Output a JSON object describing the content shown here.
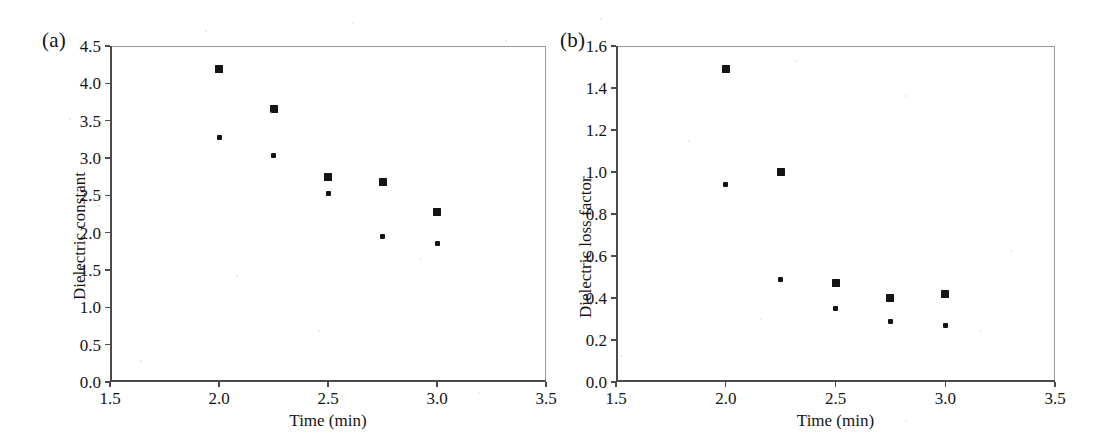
{
  "figure": {
    "background_color": "#ffffff",
    "marker_color": "#141414",
    "axis_color": "#4a4a4a",
    "panels": [
      {
        "key": "a",
        "label": "(a)",
        "chart_data": {
          "type": "scatter",
          "title": "",
          "xlabel": "Time (min)",
          "ylabel": "Dielectric constant",
          "xlim": [
            1.5,
            3.5
          ],
          "ylim": [
            0.0,
            4.5
          ],
          "xticks": [
            "1.5",
            "2.0",
            "2.5",
            "3.0",
            "3.5"
          ],
          "xtick_values": [
            1.5,
            2.0,
            2.5,
            3.0,
            3.5
          ],
          "yticks": [
            "0.0",
            "0.5",
            "1.0",
            "1.5",
            "2.0",
            "2.5",
            "3.0",
            "3.5",
            "4.0",
            "4.5"
          ],
          "ytick_values": [
            0.0,
            0.5,
            1.0,
            1.5,
            2.0,
            2.5,
            3.0,
            3.5,
            4.0,
            4.5
          ],
          "grid": false,
          "legend": "none",
          "x": [
            2.0,
            2.25,
            2.5,
            2.75,
            3.0
          ],
          "series": [
            {
              "name": "series-1",
              "marker": "square",
              "values": [
                4.19,
                3.65,
                2.74,
                2.68,
                2.28
              ]
            },
            {
              "name": "series-2",
              "marker": "diamond",
              "values": [
                3.27,
                3.03,
                2.52,
                1.95,
                1.85
              ]
            }
          ]
        }
      },
      {
        "key": "b",
        "label": "(b)",
        "chart_data": {
          "type": "scatter",
          "title": "",
          "xlabel": "Time (min)",
          "ylabel": "Dielectric loss factor",
          "xlim": [
            1.5,
            3.5
          ],
          "ylim": [
            0.0,
            1.6
          ],
          "xticks": [
            "1.5",
            "2.0",
            "2.5",
            "3.0",
            "3.5"
          ],
          "xtick_values": [
            1.5,
            2.0,
            2.5,
            3.0,
            3.5
          ],
          "yticks": [
            "0.0",
            "0.2",
            "0.4",
            "0.6",
            "0.8",
            "1.0",
            "1.2",
            "1.4",
            "1.6"
          ],
          "ytick_values": [
            0.0,
            0.2,
            0.4,
            0.6,
            0.8,
            1.0,
            1.2,
            1.4,
            1.6
          ],
          "grid": false,
          "legend": "none",
          "x": [
            2.0,
            2.25,
            2.5,
            2.75,
            3.0
          ],
          "series": [
            {
              "name": "series-1",
              "marker": "square",
              "values": [
                1.49,
                1.0,
                0.47,
                0.4,
                0.42
              ]
            },
            {
              "name": "series-2",
              "marker": "diamond",
              "values": [
                0.94,
                0.49,
                0.35,
                0.29,
                0.27
              ]
            }
          ]
        }
      }
    ]
  }
}
